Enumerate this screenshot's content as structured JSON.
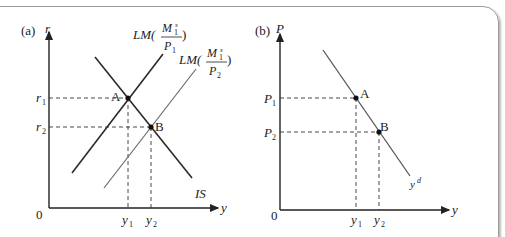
{
  "panels": {
    "a": {
      "label": "(a)",
      "y_axis": "r",
      "x_axis": "y",
      "origin": "0",
      "curves": {
        "lm1": {
          "prefix": "LM(",
          "num": "M",
          "num_sup": "s",
          "num_sub": "1",
          "den": "P",
          "den_sub": "1",
          "suffix": ")"
        },
        "lm2": {
          "prefix": "LM(",
          "num": "M",
          "num_sup": "s",
          "num_sub": "1",
          "den": "P",
          "den_sub": "2",
          "suffix": ")"
        },
        "is": "IS"
      },
      "points": {
        "a": "A",
        "b": "B"
      },
      "y_ticks": {
        "r1": "r",
        "r1_sub": "1",
        "r2": "r",
        "r2_sub": "2"
      },
      "x_ticks": {
        "y1": "y",
        "y1_sub": "1",
        "y2": "y",
        "y2_sub": "2"
      }
    },
    "b": {
      "label": "(b)",
      "y_axis": "P",
      "x_axis": "y",
      "origin": "0",
      "curve": {
        "name": "y",
        "sup": "d"
      },
      "points": {
        "a": "A",
        "b": "B"
      },
      "y_ticks": {
        "p1": "P",
        "p1_sub": "1",
        "p2": "P",
        "p2_sub": "2"
      },
      "x_ticks": {
        "y1": "y",
        "y1_sub": "1",
        "y2": "y",
        "y2_sub": "2"
      }
    }
  },
  "colors": {
    "dark_line": "#2a2a2a",
    "gray_line": "#6a6a6a",
    "frame": "#9a9a9a"
  }
}
